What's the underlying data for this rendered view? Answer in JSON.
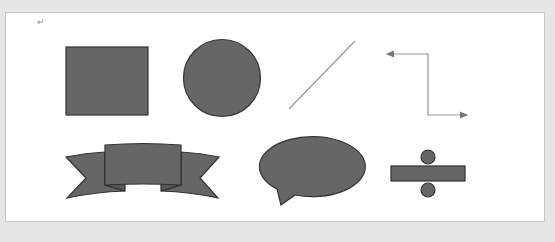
{
  "document": {
    "paragraph_mark": "↵",
    "colors": {
      "shape_fill": "#666666",
      "shape_stroke": "#333333",
      "line_color": "#999999",
      "page_bg": "#ffffff",
      "workspace_bg": "#e6e6e6"
    },
    "shapes": [
      {
        "type": "rectangle"
      },
      {
        "type": "circle"
      },
      {
        "type": "line"
      },
      {
        "type": "elbow-connector-double-arrow"
      },
      {
        "type": "ribbon-banner"
      },
      {
        "type": "oval-speech-bubble"
      },
      {
        "type": "division-sign"
      }
    ]
  }
}
